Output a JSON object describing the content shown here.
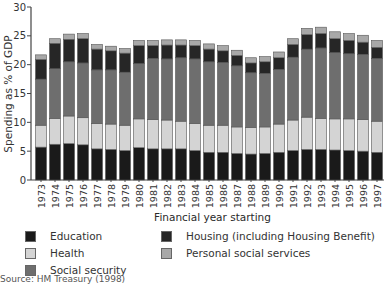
{
  "chart_data": {
    "type": "bar",
    "stacked": true,
    "title": "",
    "xlabel": "Financial year starting",
    "ylabel": "Spending as % of GDP",
    "ylim": [
      0,
      30
    ],
    "yticks": [
      0,
      5,
      10,
      15,
      20,
      25,
      30
    ],
    "grid": false,
    "legend_position": "bottom",
    "categories": [
      "1973",
      "1974",
      "1975",
      "1976",
      "1977",
      "1978",
      "1979",
      "1980",
      "1981",
      "1982",
      "1983",
      "1984",
      "1985",
      "1986",
      "1987",
      "1988",
      "1989",
      "1990",
      "1991",
      "1992",
      "1993",
      "1994",
      "1995",
      "1996",
      "1997"
    ],
    "series": [
      {
        "name": "Education",
        "color": "#1a1a1a",
        "values": [
          5.7,
          6.2,
          6.3,
          6.1,
          5.4,
          5.3,
          5.1,
          5.6,
          5.4,
          5.4,
          5.4,
          5.1,
          4.8,
          4.8,
          4.6,
          4.5,
          4.6,
          4.8,
          5.1,
          5.3,
          5.3,
          5.2,
          5.1,
          5.0,
          4.8
        ]
      },
      {
        "name": "Health",
        "color": "#d4d4d4",
        "values": [
          3.8,
          4.5,
          4.8,
          4.7,
          4.4,
          4.4,
          4.4,
          5.0,
          5.1,
          5.0,
          4.8,
          4.7,
          4.7,
          4.7,
          4.6,
          4.6,
          4.6,
          4.9,
          5.3,
          5.6,
          5.4,
          5.4,
          5.5,
          5.5,
          5.4
        ]
      },
      {
        "name": "Social security",
        "color": "#6e6e6e",
        "values": [
          8.0,
          8.6,
          9.4,
          9.5,
          9.3,
          9.4,
          9.2,
          9.6,
          10.6,
          10.6,
          11.0,
          11.2,
          11.0,
          10.9,
          10.6,
          9.5,
          9.3,
          9.5,
          10.9,
          11.8,
          12.2,
          11.5,
          11.3,
          11.3,
          10.9
        ]
      },
      {
        "name": "Housing (including Housing Benefit)",
        "color": "#262626",
        "values": [
          3.4,
          4.4,
          3.9,
          4.2,
          3.6,
          3.3,
          3.3,
          3.1,
          2.2,
          2.4,
          2.2,
          2.3,
          2.2,
          2.0,
          1.8,
          1.7,
          2.0,
          2.0,
          2.2,
          2.5,
          2.5,
          2.4,
          2.3,
          2.1,
          1.9
        ]
      },
      {
        "name": "Personal social services",
        "color": "#a8a8a8",
        "values": [
          0.8,
          0.8,
          0.9,
          0.9,
          0.8,
          0.8,
          0.8,
          0.9,
          0.9,
          0.9,
          0.9,
          0.9,
          0.9,
          0.9,
          0.9,
          0.9,
          0.9,
          1.0,
          1.0,
          1.1,
          1.1,
          1.2,
          1.2,
          1.2,
          1.2
        ]
      }
    ]
  },
  "legend": {
    "items": [
      {
        "label": "Education",
        "color": "#1a1a1a"
      },
      {
        "label": "Housing (including Housing Benefit)",
        "color": "#262626"
      },
      {
        "label": "Health",
        "color": "#d4d4d4"
      },
      {
        "label": "Personal social services",
        "color": "#a8a8a8"
      },
      {
        "label": "Social security",
        "color": "#6e6e6e"
      }
    ]
  },
  "source": "Source: HM Treasury (1998)"
}
